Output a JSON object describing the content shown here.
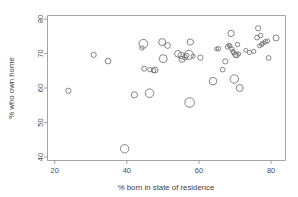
{
  "chart_data": {
    "type": "scatter",
    "title": "",
    "xlabel": "% born in state of residence",
    "ylabel": "% who own home",
    "xlim": [
      18,
      84
    ],
    "ylim": [
      39,
      81
    ],
    "xticks": [
      20,
      40,
      60,
      80
    ],
    "yticks": [
      40,
      50,
      60,
      70,
      80
    ],
    "xtick_labels": [
      "20",
      "40",
      "60",
      "80"
    ],
    "ytick_labels": [
      "40",
      "50",
      "60",
      "70",
      "80"
    ],
    "grid": false,
    "legend": "none",
    "marker": "open-circle",
    "marker_color": "#6f6f6f",
    "size_encoding": "bubble area varies by point",
    "points": [
      {
        "x": 23.8,
        "y": 59.2,
        "r": 2.6
      },
      {
        "x": 30.8,
        "y": 69.6,
        "r": 2.6
      },
      {
        "x": 34.8,
        "y": 67.8,
        "r": 2.9
      },
      {
        "x": 39.4,
        "y": 42.4,
        "r": 4.2
      },
      {
        "x": 42.1,
        "y": 58.0,
        "r": 3.1
      },
      {
        "x": 44.2,
        "y": 71.6,
        "r": 2.2
      },
      {
        "x": 44.6,
        "y": 72.8,
        "r": 4.4
      },
      {
        "x": 44.8,
        "y": 65.6,
        "r": 2.5
      },
      {
        "x": 46.3,
        "y": 58.5,
        "r": 4.3
      },
      {
        "x": 46.4,
        "y": 65.3,
        "r": 2.2
      },
      {
        "x": 47.4,
        "y": 65.1,
        "r": 2.3
      },
      {
        "x": 47.8,
        "y": 65.2,
        "r": 3.0
      },
      {
        "x": 49.8,
        "y": 73.3,
        "r": 3.5
      },
      {
        "x": 50.1,
        "y": 68.5,
        "r": 4.0
      },
      {
        "x": 51.3,
        "y": 72.3,
        "r": 2.9
      },
      {
        "x": 54.2,
        "y": 69.9,
        "r": 3.4
      },
      {
        "x": 55.1,
        "y": 69.4,
        "r": 3.2
      },
      {
        "x": 55.3,
        "y": 68.3,
        "r": 3.0
      },
      {
        "x": 56.1,
        "y": 68.9,
        "r": 2.6
      },
      {
        "x": 56.6,
        "y": 69.4,
        "r": 2.3
      },
      {
        "x": 57.2,
        "y": 69.6,
        "r": 4.6
      },
      {
        "x": 57.6,
        "y": 73.3,
        "r": 3.1
      },
      {
        "x": 57.4,
        "y": 55.8,
        "r": 4.8
      },
      {
        "x": 58.4,
        "y": 69.2,
        "r": 2.1
      },
      {
        "x": 60.4,
        "y": 68.8,
        "r": 2.7
      },
      {
        "x": 63.9,
        "y": 62.0,
        "r": 3.8
      },
      {
        "x": 64.9,
        "y": 71.3,
        "r": 1.9
      },
      {
        "x": 65.4,
        "y": 71.4,
        "r": 2.2
      },
      {
        "x": 66.6,
        "y": 65.3,
        "r": 2.3
      },
      {
        "x": 67.3,
        "y": 67.7,
        "r": 2.6
      },
      {
        "x": 67.9,
        "y": 71.9,
        "r": 2.2
      },
      {
        "x": 68.3,
        "y": 72.4,
        "r": 2.0
      },
      {
        "x": 68.6,
        "y": 72.2,
        "r": 2.1
      },
      {
        "x": 68.9,
        "y": 75.8,
        "r": 3.2
      },
      {
        "x": 69.1,
        "y": 71.3,
        "r": 2.2
      },
      {
        "x": 69.4,
        "y": 70.6,
        "r": 2.1
      },
      {
        "x": 69.7,
        "y": 70.2,
        "r": 2.3
      },
      {
        "x": 69.8,
        "y": 62.6,
        "r": 4.2
      },
      {
        "x": 70.1,
        "y": 69.6,
        "r": 2.5
      },
      {
        "x": 70.4,
        "y": 69.5,
        "r": 2.8
      },
      {
        "x": 70.7,
        "y": 72.6,
        "r": 2.2
      },
      {
        "x": 71.0,
        "y": 69.9,
        "r": 2.1
      },
      {
        "x": 71.3,
        "y": 60.0,
        "r": 3.5
      },
      {
        "x": 73.0,
        "y": 70.9,
        "r": 2.0
      },
      {
        "x": 74.0,
        "y": 70.3,
        "r": 2.2
      },
      {
        "x": 75.2,
        "y": 70.6,
        "r": 2.1
      },
      {
        "x": 76.1,
        "y": 74.6,
        "r": 2.4
      },
      {
        "x": 76.4,
        "y": 77.3,
        "r": 2.6
      },
      {
        "x": 76.8,
        "y": 72.2,
        "r": 2.0
      },
      {
        "x": 77.1,
        "y": 75.2,
        "r": 2.3
      },
      {
        "x": 77.4,
        "y": 72.6,
        "r": 2.1
      },
      {
        "x": 77.8,
        "y": 73.0,
        "r": 2.0
      },
      {
        "x": 78.4,
        "y": 73.4,
        "r": 2.2
      },
      {
        "x": 79.0,
        "y": 73.6,
        "r": 2.1
      },
      {
        "x": 79.3,
        "y": 68.7,
        "r": 2.4
      },
      {
        "x": 81.4,
        "y": 74.5,
        "r": 3.0
      }
    ]
  }
}
